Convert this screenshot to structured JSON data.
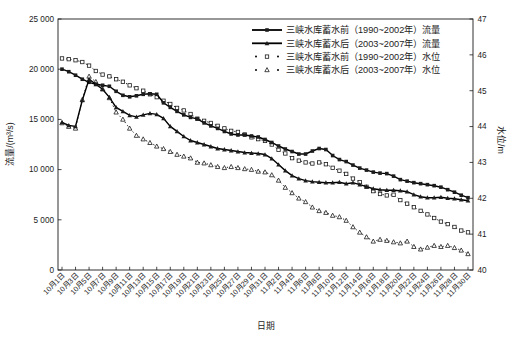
{
  "figure": {
    "background": "#ffffff",
    "ink_color": "#1c1c1c"
  },
  "chart_data": {
    "type": "line",
    "title": "",
    "xlabel": "日期",
    "ylabel_left": "流量/(m³/s)",
    "ylabel_right": "水位/m",
    "grid": false,
    "legend_position": "top-right-inside",
    "y_left_axis": {
      "min": 0,
      "max": 25000,
      "tick_step": 5000,
      "tick_labels": [
        "0",
        "5 000",
        "10 000",
        "15 000",
        "20 000",
        "25 000"
      ]
    },
    "y_right_axis": {
      "min": 40,
      "max": 47,
      "tick_labels": [
        "40",
        "41",
        "42",
        "43",
        "44",
        "45",
        "46",
        "47"
      ]
    },
    "x_axis": {
      "points_per_day": 1,
      "days_total": 61,
      "tick_every_days": 2,
      "tick_labels": [
        "10月1日",
        "10月3日",
        "10月5日",
        "10月7日",
        "10月9日",
        "10月11日",
        "10月13日",
        "10月15日",
        "10月17日",
        "10月19日",
        "10月21日",
        "10月23日",
        "10月25日",
        "10月27日",
        "10月29日",
        "10月31日",
        "11月2日",
        "11月4日",
        "11月6日",
        "11月8日",
        "11月10日",
        "11月12日",
        "11月14日",
        "11月16日",
        "11月18日",
        "11月20日",
        "11月22日",
        "11月24日",
        "11月26日",
        "11月28日",
        "11月30日"
      ]
    },
    "series": [
      {
        "name": "三峡水库蓄水前（1990~2002年）流量",
        "axis": "left",
        "marker": "filled-square",
        "line": "solid",
        "color": "#000000",
        "values": [
          20000,
          19750,
          19400,
          19000,
          18700,
          18500,
          18400,
          18300,
          17800,
          17400,
          17250,
          17350,
          17500,
          17550,
          17500,
          16650,
          16200,
          15800,
          15450,
          15200,
          15050,
          14650,
          14350,
          14100,
          13800,
          13550,
          13450,
          13450,
          13350,
          13250,
          13000,
          12700,
          12350,
          12050,
          11800,
          11550,
          11550,
          11850,
          12100,
          12000,
          11400,
          11000,
          10800,
          10450,
          10150,
          9950,
          9750,
          9650,
          9600,
          9350,
          9000,
          8850,
          8700,
          8600,
          8500,
          8400,
          8250,
          8000,
          7750,
          7450,
          7200
        ]
      },
      {
        "name": "三峡水库蓄水后（2003~2007年）流量",
        "axis": "left",
        "marker": "filled-triangle",
        "line": "solid",
        "color": "#000000",
        "values": [
          14700,
          14400,
          14300,
          16900,
          19000,
          18500,
          18000,
          17200,
          16200,
          15800,
          15400,
          15250,
          15450,
          15600,
          15500,
          15100,
          14300,
          13800,
          13300,
          12900,
          12700,
          12500,
          12300,
          12100,
          12000,
          11900,
          11800,
          11700,
          11650,
          11600,
          11500,
          11100,
          10500,
          9900,
          9400,
          9100,
          8900,
          8800,
          8750,
          8700,
          8700,
          8750,
          8600,
          8700,
          8500,
          8300,
          8100,
          8000,
          7950,
          7950,
          7900,
          7800,
          7500,
          7300,
          7200,
          7200,
          7250,
          7150,
          7100,
          7000,
          6900
        ]
      },
      {
        "name": "三峡水库蓄水前（1990~2002年）水位",
        "axis": "right",
        "marker": "open-square",
        "line": "dotted",
        "color": "#000000",
        "values": [
          45.9,
          45.88,
          45.85,
          45.8,
          45.7,
          45.55,
          45.45,
          45.4,
          45.32,
          45.25,
          45.15,
          45.07,
          45.0,
          44.9,
          44.82,
          44.72,
          44.63,
          44.52,
          44.45,
          44.35,
          44.22,
          44.16,
          44.1,
          44.02,
          43.95,
          43.88,
          43.85,
          43.78,
          43.7,
          43.65,
          43.6,
          43.5,
          43.35,
          43.25,
          43.12,
          43.05,
          43.0,
          42.97,
          43.0,
          42.95,
          42.85,
          42.77,
          42.68,
          42.55,
          42.45,
          42.32,
          42.2,
          42.12,
          42.08,
          42.1,
          41.95,
          41.85,
          41.75,
          41.65,
          41.55,
          41.45,
          41.35,
          41.28,
          41.2,
          41.1,
          41.05
        ]
      },
      {
        "name": "三峡水库蓄水后（2003~2007年）水位",
        "axis": "right",
        "marker": "open-triangle",
        "line": "dotted",
        "color": "#000000",
        "values": [
          44.1,
          44.0,
          43.95,
          44.75,
          45.4,
          45.25,
          45.05,
          44.8,
          44.4,
          44.2,
          43.95,
          43.75,
          43.65,
          43.55,
          43.45,
          43.38,
          43.3,
          43.22,
          43.17,
          43.12,
          43.0,
          42.98,
          42.93,
          42.88,
          42.85,
          42.88,
          42.85,
          42.82,
          42.8,
          42.75,
          42.73,
          42.65,
          42.5,
          42.3,
          42.15,
          42.0,
          41.9,
          41.75,
          41.65,
          41.6,
          41.52,
          41.48,
          41.38,
          41.2,
          41.05,
          40.92,
          40.8,
          40.85,
          40.82,
          40.78,
          40.75,
          40.8,
          40.65,
          40.58,
          40.63,
          40.68,
          40.65,
          40.68,
          40.62,
          40.55,
          40.45
        ]
      }
    ]
  }
}
